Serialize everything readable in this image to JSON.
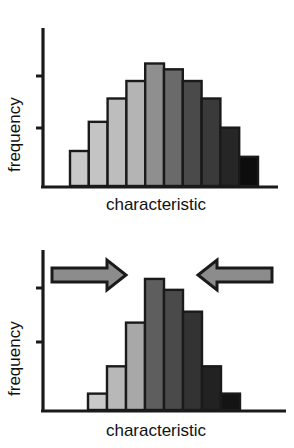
{
  "figure": {
    "title": "",
    "panels": [
      {
        "id": "panel-top",
        "name": "before-selection-histogram",
        "xlabel": "characteristic",
        "ylabel": "frequency",
        "annotations": []
      },
      {
        "id": "panel-bottom",
        "name": "after-selection-histogram",
        "xlabel": "characteristic",
        "ylabel": "frequency",
        "annotations": [
          {
            "name": "left-arrow-annotation",
            "direction": "right",
            "label": ""
          },
          {
            "name": "right-arrow-annotation",
            "direction": "left",
            "label": ""
          }
        ]
      }
    ],
    "colors": {
      "axis": "#1a1a1a",
      "bar_outline": "#1a1a1a",
      "arrow_fill": "#8c8c8c",
      "arrow_outline": "#1a1a1a",
      "background": "#ffffff",
      "text": "#111111"
    }
  },
  "chart_data": [
    {
      "type": "bar",
      "name": "panel-top",
      "title": "",
      "subtitle": "",
      "xlabel": "characteristic",
      "ylabel": "frequency",
      "categories": [
        "1",
        "2",
        "3",
        "4",
        "5",
        "6",
        "7",
        "8",
        "9",
        "10"
      ],
      "values": [
        3,
        5.5,
        7.5,
        9,
        10.5,
        10,
        9,
        7.5,
        5,
        2.5
      ],
      "bar_colors": [
        "#c9c9c9",
        "#c4c4c4",
        "#bdbdbd",
        "#b4b4b4",
        "#8f8f8f",
        "#6a6a6a",
        "#4a4a4a",
        "#3a3a3a",
        "#262626",
        "#0d0d0d"
      ],
      "xlim": [
        0,
        10
      ],
      "ylim": [
        0,
        12
      ],
      "grid": false,
      "legend": null,
      "axis_ticks": {
        "x": [],
        "y": [
          "tick",
          "tick"
        ]
      }
    },
    {
      "type": "bar",
      "name": "panel-bottom",
      "title": "",
      "subtitle": "",
      "xlabel": "characteristic",
      "ylabel": "frequency",
      "categories": [
        "1",
        "2",
        "3",
        "4",
        "5",
        "6",
        "7",
        "8"
      ],
      "values": [
        1.5,
        4,
        8,
        12,
        11,
        9,
        4,
        1.5
      ],
      "bar_colors": [
        "#c9c9c9",
        "#b8b8b8",
        "#a8a8a8",
        "#5e5e5e",
        "#4a4a4a",
        "#333333",
        "#222222",
        "#141414"
      ],
      "xlim": [
        0,
        8
      ],
      "ylim": [
        0,
        13
      ],
      "grid": false,
      "legend": null,
      "axis_ticks": {
        "x": [],
        "y": [
          "tick",
          "tick"
        ]
      },
      "annotations": [
        {
          "type": "arrow",
          "direction": "right",
          "x_from": 0.6,
          "x_to": 3.1,
          "y": 11.2
        },
        {
          "type": "arrow",
          "direction": "left",
          "x_from": 9.4,
          "x_to": 6.2,
          "y": 11.2
        }
      ]
    }
  ]
}
